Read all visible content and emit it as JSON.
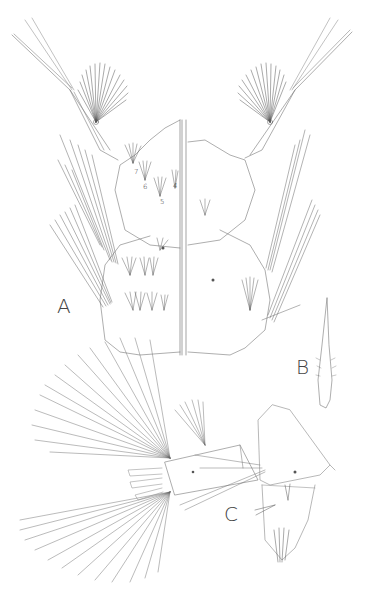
{
  "figure": {
    "panels": [
      {
        "id": "A",
        "label": "A",
        "description": "Larval head and thorax, dorsal/ventral halves"
      },
      {
        "id": "B",
        "label": "B",
        "description": "Single spine/scale"
      },
      {
        "id": "C",
        "label": "C",
        "description": "Terminal abdominal segments with siphon and fans"
      }
    ],
    "seta_numbers": [
      "7",
      "6",
      "5",
      "4"
    ],
    "colors": {
      "ink": "#555555",
      "background": "#ffffff"
    }
  }
}
